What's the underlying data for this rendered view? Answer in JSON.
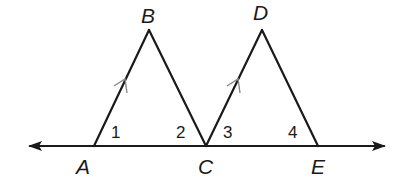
{
  "diagram": {
    "colors": {
      "line": "#1a1a1a",
      "parallel_marks": "#8a8a8a",
      "background": "#ffffff"
    },
    "points": {
      "A": {
        "label": "A",
        "x": 94,
        "y": 146
      },
      "B": {
        "label": "B",
        "x": 149,
        "y": 30
      },
      "C": {
        "label": "C",
        "x": 206,
        "y": 146
      },
      "D": {
        "label": "D",
        "x": 262,
        "y": 30
      },
      "E": {
        "label": "E",
        "x": 318,
        "y": 146
      }
    },
    "line": {
      "name": "line ACE",
      "from_x": 28,
      "to_x": 386,
      "y": 146,
      "arrows": "both"
    },
    "segments": [
      "AB",
      "BC",
      "CD",
      "DE"
    ],
    "parallel_marks": [
      "AB",
      "CD"
    ],
    "angles": [
      {
        "label": "1",
        "vertex": "A"
      },
      {
        "label": "2",
        "vertex": "C"
      },
      {
        "label": "3",
        "vertex": "C"
      },
      {
        "label": "4",
        "vertex": "E"
      }
    ]
  }
}
